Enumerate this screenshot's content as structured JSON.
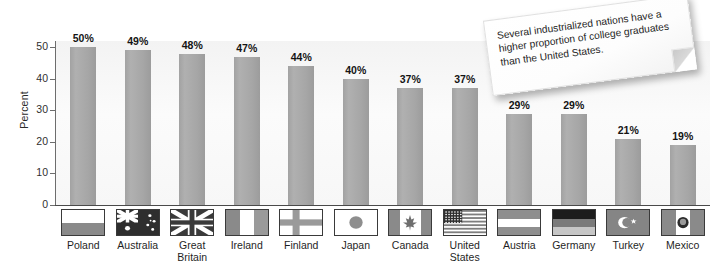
{
  "chart_data": {
    "type": "bar",
    "title": "",
    "xlabel": "",
    "ylabel": "Percent",
    "ylim": [
      0,
      52
    ],
    "y_ticks": [
      0,
      10,
      20,
      30,
      40,
      50
    ],
    "grid": false,
    "legend_position": "none",
    "value_label_suffix": "%",
    "categories": [
      "Poland",
      "Australia",
      "Great Britain",
      "Ireland",
      "Finland",
      "Japan",
      "Canada",
      "United States",
      "Austria",
      "Germany",
      "Turkey",
      "Mexico"
    ],
    "category_labels": [
      "Poland",
      "Australia",
      "Great\nBritain",
      "Ireland",
      "Finland",
      "Japan",
      "Canada",
      "United\nStates",
      "Austria",
      "Germany",
      "Turkey",
      "Mexico"
    ],
    "values": [
      50,
      49,
      48,
      47,
      44,
      40,
      37,
      37,
      29,
      29,
      21,
      19
    ],
    "value_labels": [
      "50%",
      "49%",
      "48%",
      "47%",
      "44%",
      "40%",
      "37%",
      "37%",
      "29%",
      "29%",
      "21%",
      "19%"
    ],
    "flags": [
      "poland-flag",
      "australia-flag",
      "great-britain-flag",
      "ireland-flag",
      "finland-flag",
      "japan-flag",
      "canada-flag",
      "united-states-flag",
      "austria-flag",
      "germany-flag",
      "turkey-flag",
      "mexico-flag"
    ]
  },
  "annotation": {
    "text": "Several industrialized nations have a higher proportion of college graduates than the United States."
  },
  "colors": {
    "bar": "#a8a8a8",
    "plot_background": "#f6f6f6",
    "axis": "#4a4a4a",
    "tick": "#6d6d6d",
    "text": "#1a1a1a",
    "note_background": "#ffffff"
  }
}
